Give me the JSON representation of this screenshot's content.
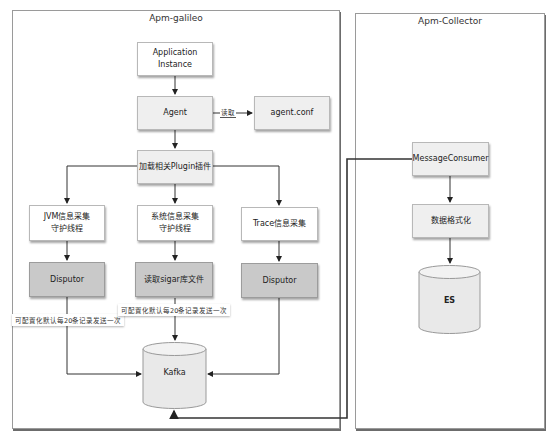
{
  "containers": {
    "galileo": {
      "title": "Apm-galileo"
    },
    "collector": {
      "title": "Apm-Collector"
    }
  },
  "nodes": {
    "app_instance": "Application Instance",
    "agent": "Agent",
    "agent_conf": "agent.conf",
    "plugin_loader": "加载相关Plugin插件",
    "jvm_collector_line1": "JVM信息采集",
    "jvm_collector_line2": "守护线程",
    "sys_collector_line1": "系统信息采集",
    "sys_collector_line2": "守护线程",
    "trace_collector": "Trace信息采集",
    "jvm_disputor": "Disputor",
    "sigar_reader": "读取sigar库文件",
    "trace_disputor": "Disputor",
    "kafka": "Kafka",
    "message_consumer": "MessageConsumer",
    "data_formatter": "数据格式化",
    "es": "ES"
  },
  "edge_labels": {
    "agent_reads_conf": "读取"
  },
  "notes": {
    "jvm_batch": "可配置化默认每20条记录发送一次",
    "sys_batch": "可配置化默认每20条记录发送一次"
  },
  "colors": {
    "node_white": "#ffffff",
    "node_light": "#efefef",
    "node_dark": "#c9c9c9",
    "line": "#333333"
  }
}
